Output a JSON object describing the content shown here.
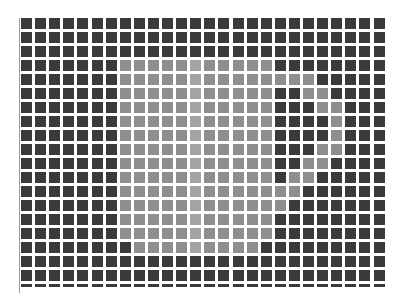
{
  "image": {
    "description": "Grid of square tiles forming a light circular region with a dark crescent cut-out on the right",
    "width": 407,
    "height": 306
  },
  "grid": {
    "columns": 26,
    "rows": 20,
    "origin_x": 21,
    "origin_y": 18,
    "pitch_x": 14.1,
    "pitch_y": 14,
    "cell_size": 11,
    "last_row_height": 3,
    "colors": {
      "0": "#3a3a3a",
      "1": "#8e8e8e",
      "2": "#a4a4a4"
    },
    "legend": {
      "0": "dark tile",
      "1": "light tile",
      "2": "highlight tile"
    },
    "cells": [
      [
        0,
        0,
        0,
        0,
        0,
        0,
        0,
        0,
        0,
        0,
        0,
        0,
        0,
        0,
        0,
        0,
        0,
        0,
        0,
        0,
        0,
        0,
        0,
        0,
        0,
        0
      ],
      [
        0,
        0,
        0,
        0,
        0,
        0,
        0,
        0,
        0,
        0,
        0,
        0,
        0,
        0,
        0,
        0,
        0,
        0,
        0,
        0,
        0,
        0,
        0,
        0,
        0,
        0
      ],
      [
        0,
        0,
        0,
        0,
        0,
        0,
        0,
        0,
        0,
        0,
        0,
        0,
        0,
        0,
        0,
        0,
        0,
        0,
        0,
        0,
        0,
        0,
        0,
        0,
        0,
        0
      ],
      [
        0,
        0,
        0,
        0,
        0,
        0,
        0,
        1,
        1,
        1,
        1,
        1,
        2,
        1,
        1,
        1,
        1,
        1,
        0,
        0,
        0,
        0,
        0,
        0,
        0,
        0
      ],
      [
        0,
        0,
        0,
        0,
        0,
        0,
        0,
        1,
        1,
        1,
        1,
        1,
        2,
        1,
        1,
        1,
        1,
        1,
        1,
        1,
        1,
        0,
        0,
        0,
        0,
        0
      ],
      [
        0,
        0,
        0,
        0,
        0,
        0,
        0,
        1,
        1,
        1,
        1,
        1,
        2,
        1,
        1,
        1,
        1,
        1,
        0,
        0,
        1,
        1,
        0,
        0,
        0,
        0
      ],
      [
        0,
        0,
        0,
        0,
        0,
        0,
        0,
        1,
        1,
        1,
        1,
        1,
        2,
        1,
        1,
        1,
        1,
        1,
        0,
        0,
        0,
        1,
        1,
        0,
        0,
        0
      ],
      [
        0,
        0,
        0,
        0,
        0,
        0,
        0,
        1,
        1,
        1,
        1,
        1,
        2,
        1,
        1,
        1,
        1,
        1,
        0,
        0,
        0,
        0,
        1,
        0,
        0,
        0
      ],
      [
        0,
        0,
        0,
        0,
        0,
        0,
        0,
        1,
        1,
        1,
        1,
        1,
        2,
        1,
        1,
        1,
        1,
        1,
        0,
        0,
        0,
        0,
        1,
        0,
        0,
        0
      ],
      [
        0,
        0,
        0,
        0,
        0,
        0,
        0,
        1,
        1,
        1,
        1,
        1,
        2,
        1,
        1,
        1,
        1,
        1,
        0,
        0,
        0,
        1,
        1,
        0,
        0,
        0
      ],
      [
        0,
        0,
        0,
        0,
        0,
        0,
        0,
        1,
        1,
        1,
        1,
        1,
        2,
        1,
        1,
        1,
        1,
        1,
        0,
        0,
        1,
        1,
        0,
        0,
        0,
        0
      ],
      [
        0,
        0,
        0,
        0,
        0,
        0,
        0,
        1,
        1,
        1,
        1,
        1,
        2,
        1,
        1,
        1,
        1,
        1,
        0,
        1,
        1,
        0,
        0,
        0,
        0,
        0
      ],
      [
        0,
        0,
        0,
        0,
        0,
        0,
        0,
        1,
        1,
        1,
        1,
        1,
        2,
        1,
        1,
        1,
        1,
        1,
        1,
        1,
        0,
        0,
        0,
        0,
        0,
        0
      ],
      [
        0,
        0,
        0,
        0,
        0,
        0,
        0,
        1,
        1,
        1,
        1,
        1,
        2,
        1,
        1,
        1,
        1,
        1,
        1,
        0,
        0,
        0,
        0,
        0,
        0,
        0
      ],
      [
        0,
        0,
        0,
        0,
        0,
        0,
        0,
        1,
        1,
        1,
        1,
        1,
        2,
        1,
        1,
        1,
        1,
        1,
        0,
        0,
        0,
        0,
        0,
        0,
        0,
        0
      ],
      [
        0,
        0,
        0,
        0,
        0,
        0,
        0,
        1,
        1,
        1,
        1,
        1,
        2,
        1,
        1,
        1,
        1,
        1,
        0,
        0,
        0,
        0,
        0,
        0,
        0,
        0
      ],
      [
        0,
        0,
        0,
        0,
        0,
        0,
        0,
        0,
        1,
        1,
        1,
        1,
        2,
        1,
        1,
        1,
        1,
        0,
        0,
        0,
        0,
        0,
        0,
        0,
        0,
        0
      ],
      [
        0,
        0,
        0,
        0,
        0,
        0,
        0,
        0,
        0,
        0,
        0,
        0,
        0,
        0,
        0,
        0,
        0,
        0,
        0,
        0,
        0,
        0,
        0,
        0,
        0,
        0
      ],
      [
        0,
        0,
        0,
        0,
        0,
        0,
        0,
        0,
        0,
        0,
        0,
        0,
        0,
        0,
        0,
        0,
        0,
        0,
        0,
        0,
        0,
        0,
        0,
        0,
        0,
        0
      ],
      [
        0,
        0,
        0,
        0,
        0,
        0,
        0,
        0,
        0,
        0,
        0,
        0,
        0,
        0,
        0,
        0,
        0,
        0,
        0,
        0,
        0,
        0,
        0,
        0,
        0,
        0
      ]
    ]
  }
}
